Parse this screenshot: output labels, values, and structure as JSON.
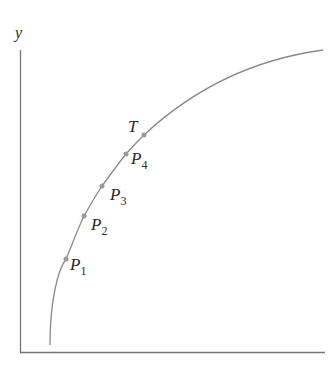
{
  "diagram": {
    "axes": {
      "y_label": "y",
      "x_label": ""
    },
    "colors": {
      "axis": "#777777",
      "curve": "#8a8a8a",
      "point": "#9a9a9a",
      "text": "#2a2a2a"
    },
    "points": [
      {
        "name": "P",
        "sub": "1",
        "x": 66,
        "y": 259
      },
      {
        "name": "P",
        "sub": "2",
        "x": 84,
        "y": 216
      },
      {
        "name": "P",
        "sub": "3",
        "x": 102,
        "y": 186
      },
      {
        "name": "P",
        "sub": "4",
        "x": 126,
        "y": 154
      },
      {
        "name": "T",
        "sub": "",
        "x": 144,
        "y": 135
      }
    ]
  }
}
